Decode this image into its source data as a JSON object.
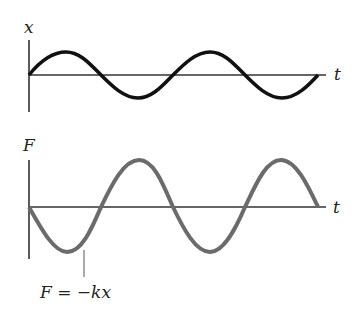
{
  "top_plot": {
    "y_label": "x",
    "x_label": "t",
    "curve_color": "#111111",
    "description": "displacement x vs time t, sine starting upward"
  },
  "bottom_plot": {
    "y_label": "F",
    "x_label": "t",
    "curve_color": "#6b6b6b",
    "description": "force F vs time t, inverted sine with double amplitude",
    "annotation": {
      "F": "F",
      "eq": " = −",
      "k": "k",
      "x": "x"
    }
  }
}
